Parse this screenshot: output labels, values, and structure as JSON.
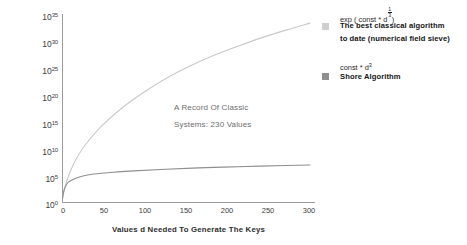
{
  "chart_data": {
    "type": "line",
    "title": "",
    "xlabel": "Values d Needed To Generate The Keys",
    "ylabel": "Number Of Operations",
    "xlim": [
      0,
      315
    ],
    "ylim": [
      0,
      35
    ],
    "yscale": "log10-exponent",
    "grid": false,
    "xticks": [
      "0",
      "50",
      "100",
      "150",
      "200",
      "250",
      "300"
    ],
    "xtick_values": [
      0,
      50,
      100,
      150,
      200,
      250,
      300
    ],
    "yticks": [
      "0",
      "5",
      "10",
      "15",
      "20",
      "25",
      "30",
      "35"
    ],
    "ytick_values": [
      0,
      5,
      10,
      15,
      20,
      25,
      30,
      35
    ],
    "ytick_base": "10",
    "legend_position": "right",
    "annotations": [
      {
        "line1": "A Record Of Classic",
        "line2": "Systems: 230 Values",
        "value": 230
      }
    ],
    "series": [
      {
        "name": "The best classical algorithm to date (numerical field sieve)",
        "formula": "exp ( const * d^(1/3) )",
        "color": "#c9c9c9",
        "x": [
          0,
          2,
          5,
          10,
          20,
          30,
          50,
          75,
          100,
          130,
          160,
          190,
          220,
          250,
          280,
          310
        ],
        "y_log10": [
          0,
          1.7,
          3.4,
          5.6,
          8.6,
          10.8,
          14.2,
          17.5,
          20.2,
          23.0,
          25.3,
          27.3,
          29.0,
          30.6,
          32.0,
          33.3
        ]
      },
      {
        "name": "Shore Algorithm",
        "formula": "const * d^3",
        "color": "#8f8f8f",
        "x": [
          0,
          1,
          2,
          4,
          8,
          15,
          25,
          40,
          60,
          90,
          130,
          180,
          230,
          280,
          310
        ],
        "y_log10": [
          0,
          1.0,
          1.9,
          2.8,
          3.7,
          4.3,
          4.8,
          5.2,
          5.5,
          5.8,
          6.1,
          6.4,
          6.6,
          6.8,
          6.9
        ]
      }
    ]
  },
  "axes": {
    "ylabel": "Number Of Operations",
    "xlabel": "Values d Needed To Generate The Keys",
    "ytick_base": "10",
    "yticks": [
      "35",
      "30",
      "25",
      "20",
      "15",
      "10",
      "5",
      "0"
    ],
    "xticks": [
      "0",
      "50",
      "100",
      "150",
      "200",
      "250",
      "300"
    ]
  },
  "annotation": {
    "line1": "A Record Of Classic",
    "line2": "Systems: 230 Values"
  },
  "legend": {
    "entries": [
      {
        "expr_prefix": "exp ( const * d",
        "expr_num": "1",
        "expr_den": "3",
        "expr_suffix": ")",
        "label_line1": "The best classical algorithm",
        "label_line2": "to date (numerical field sieve)",
        "color": "#c9c9c9"
      },
      {
        "expr_prefix": "const * d",
        "expr_exp": "3",
        "label_line1": "Shore Algorithm",
        "label_line2": "",
        "color": "#8f8f8f"
      }
    ]
  }
}
